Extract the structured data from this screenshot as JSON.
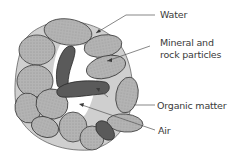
{
  "diagram": {
    "labels": {
      "water": "Water",
      "mineral_line1": "Mineral and",
      "mineral_line2": "rock particles",
      "organic": "Organic matter",
      "air": "Air"
    },
    "colors": {
      "particle_fill": "#b4b4b4",
      "water_fill": "#cfcfcf",
      "organic_fill": "#5a5a5a",
      "outline": "#3a3a3a",
      "leader_line": "#555555",
      "text": "#3a3a3a"
    }
  }
}
